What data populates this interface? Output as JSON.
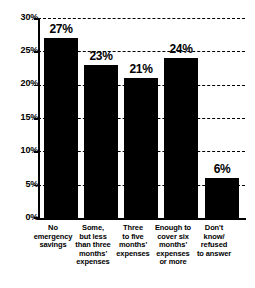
{
  "chart_data": {
    "type": "bar",
    "title": "",
    "xlabel": "",
    "ylabel": "",
    "categories": [
      "No\nemergency\nsavings",
      "Some,\nbut less\nthan three\nmonths'\nexpenses",
      "Three\nto five\nmonths'\nexpenses",
      "Enough to\ncover six\nmonths'\nexpenses\nor more",
      "Don't\nknow/\nrefused\nto answer"
    ],
    "values": [
      27,
      23,
      21,
      24,
      6
    ],
    "value_labels": [
      "27%",
      "23%",
      "21%",
      "24%",
      "6%"
    ],
    "ylim": [
      0,
      30
    ],
    "yticks": [
      0,
      5,
      10,
      15,
      20,
      25,
      30
    ],
    "ytick_labels": [
      "0%",
      "5%",
      "10%",
      "15%",
      "20%",
      "25%",
      "30%"
    ],
    "grid": true,
    "grid_style": "dashed",
    "legend": false,
    "bar_color": "#000000",
    "background_color": "#FFFFFF",
    "axis_color": "#000000"
  }
}
